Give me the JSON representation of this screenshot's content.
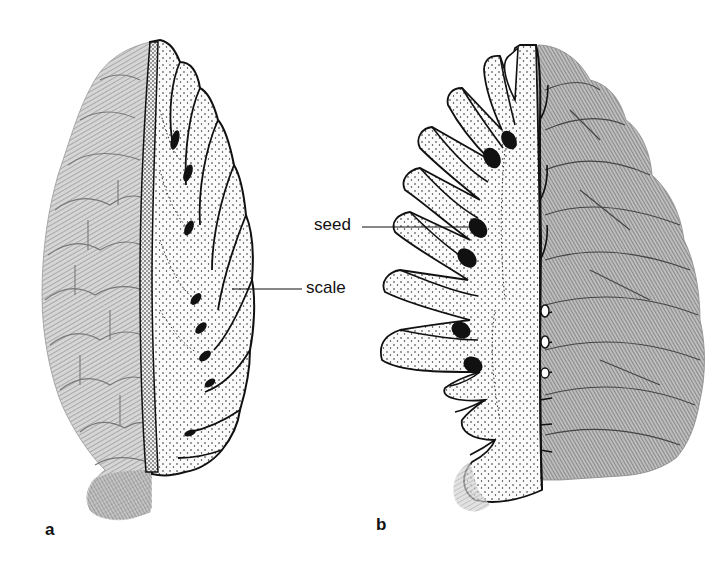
{
  "figure": {
    "panels": [
      {
        "id": "a",
        "letter": "a",
        "description": "Pine cone with right half cut away showing longitudinal section through cone axis and scales"
      },
      {
        "id": "b",
        "letter": "b",
        "description": "Pine cone with left half cut away showing open scales with seeds in longitudinal section"
      }
    ],
    "callouts": {
      "seed": "seed",
      "scale": "scale"
    },
    "colors": {
      "ink": "#111111",
      "stipple_fill": "#f4f4f4",
      "cone_shade_light": "#c8c8c8",
      "cone_shade_dark": "#8a8a8a",
      "background": "#ffffff"
    }
  }
}
